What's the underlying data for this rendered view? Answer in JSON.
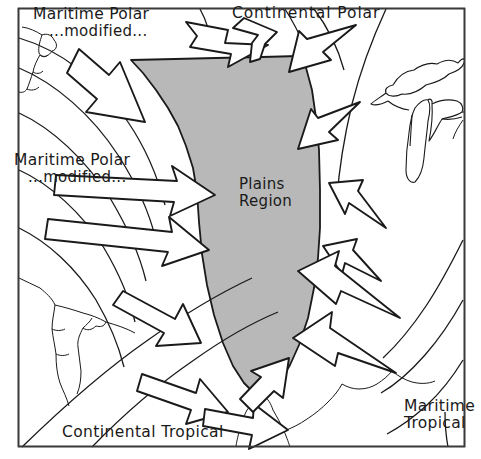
{
  "figure": {
    "frame_color": "#333333",
    "background_color": "#ffffff",
    "plains_fill_color": "#b8b8b8",
    "outline_color": "#1a1a1a",
    "width": 481,
    "height": 459
  },
  "labels": {
    "maritime_polar_north": {
      "line1": "Maritime Polar",
      "line2": "...modified..."
    },
    "maritime_polar_west": {
      "line1": "Maritime Polar",
      "line2": "...modified..."
    },
    "continental_polar": {
      "line1": "Continental  Polar"
    },
    "continental_tropical": {
      "line1": "Continental Tropical"
    },
    "maritime_tropical": {
      "line1": "Maritime",
      "line2": "Tropical"
    },
    "plains_region": {
      "line1": "Plains",
      "line2": "Region"
    }
  },
  "air_masses": [
    {
      "name": "Maritime Polar modified",
      "direction": "from northwest",
      "arrows": 1
    },
    {
      "name": "Maritime Polar modified",
      "direction": "from west",
      "arrows": 2
    },
    {
      "name": "Continental Polar",
      "direction": "from north",
      "arrows": 2
    },
    {
      "name": "Continental Tropical",
      "direction": "from southwest",
      "arrows": 3
    },
    {
      "name": "Maritime Tropical",
      "direction": "from southeast",
      "arrows": 2
    }
  ],
  "features": {
    "mountain_front": "hatched barrier along western edge of Plains Region",
    "great_lakes": "Lake Superior, Lake Michigan, Lake Huron outlines",
    "baja_california": "west coast of Mexico and Baja peninsula outline"
  }
}
